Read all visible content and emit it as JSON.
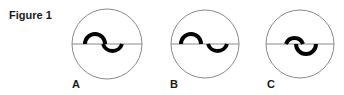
{
  "figure": {
    "title": "Figure 1",
    "panels": [
      {
        "label": "A",
        "arrangement": "continuous-s",
        "description": "Upper and lower semicircular arcs joined end-to-end forming an S across a horizontal diameter"
      },
      {
        "label": "B",
        "arrangement": "separated",
        "description": "Upper and lower semicircular arcs separated by a gap along the horizontal diameter"
      },
      {
        "label": "C",
        "arrangement": "overlapping",
        "description": "Upper and lower semicircular arcs overlapping across the horizontal diameter"
      }
    ],
    "colors": {
      "outline": "#8a8a8a",
      "curve": "#000000",
      "text": "#1a1a1a"
    }
  }
}
